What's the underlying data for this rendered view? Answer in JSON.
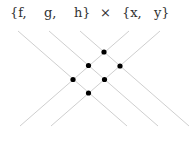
{
  "labels": {
    "f": "{f,",
    "g": "g,",
    "h": "h}",
    "times": "×",
    "x": "{x,",
    "y": "y}"
  },
  "diagram": {
    "set_a": [
      "f",
      "g",
      "h"
    ],
    "set_b": [
      "x",
      "y"
    ],
    "intersections": 6,
    "line_color": "#cccccc",
    "dot_color": "#000000"
  }
}
